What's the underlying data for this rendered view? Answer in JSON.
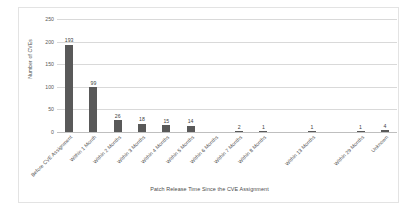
{
  "chart_data": {
    "type": "bar",
    "title": "",
    "xlabel": "Patch Release Time Since the CVE Assignment",
    "ylabel": "Number of CVEs",
    "ylim": [
      0,
      250
    ],
    "yticks": [
      0,
      50,
      100,
      150,
      200,
      250
    ],
    "grid": true,
    "legend": "none",
    "bar_color": "#595959",
    "gridline_color": "#d9d9d9",
    "categories": [
      "Before CVE Assignment",
      "Within 1 Month",
      "Within 2 Months",
      "Within 3 Months",
      "Within 4 Months",
      "Within 5 Months",
      "Within 6 Months",
      "Within 7 Months",
      "Within 8 Months",
      "",
      "Within 13 Months",
      "",
      "Within 29 Months",
      "Unknown"
    ],
    "values": [
      193,
      99,
      26,
      18,
      15,
      14,
      0,
      2,
      1,
      0,
      1,
      0,
      1,
      4
    ],
    "data_labels": [
      "193",
      "99",
      "26",
      "18",
      "15",
      "14",
      "",
      "2",
      "1",
      "",
      "1",
      "",
      "1",
      "4"
    ]
  }
}
